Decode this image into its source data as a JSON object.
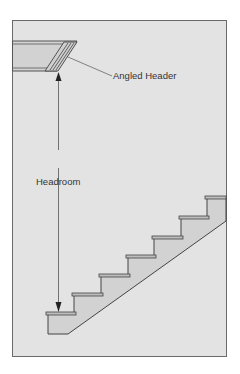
{
  "diagram": {
    "labels": {
      "header": "Angled Header",
      "headroom": "Headroom"
    },
    "colors": {
      "page_background": "#ffffff",
      "panel_background": "#e3e3e3",
      "stair_fill": "#d2d2d2",
      "line": "#555555",
      "text": "#333333"
    },
    "stairs": {
      "step_count": 7
    }
  }
}
